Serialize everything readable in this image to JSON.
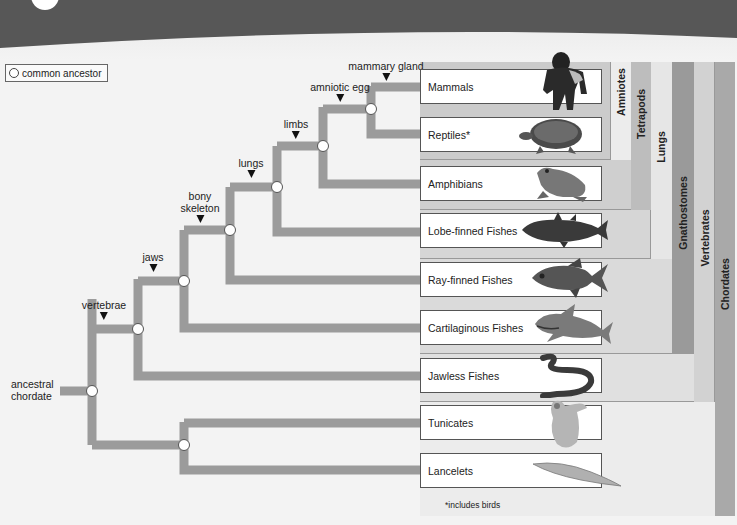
{
  "legend": {
    "label": "common ancestor"
  },
  "root": {
    "label_line1": "ancestral",
    "label_line2": "chordate"
  },
  "traits": [
    {
      "label": "mammary gland"
    },
    {
      "label": "amniotic egg"
    },
    {
      "label": "limbs"
    },
    {
      "label": "lungs"
    },
    {
      "label_line1": "bony",
      "label_line2": "skeleton"
    },
    {
      "label": "jaws"
    },
    {
      "label": "vertebrae"
    }
  ],
  "taxa": [
    {
      "label": "Mammals",
      "animal": "gorilla"
    },
    {
      "label": "Reptiles*",
      "animal": "turtle"
    },
    {
      "label": "Amphibians",
      "animal": "frog"
    },
    {
      "label": "Lobe-finned Fishes",
      "animal": "coelacanth"
    },
    {
      "label": "Ray-finned Fishes",
      "animal": "fish"
    },
    {
      "label": "Cartilaginous Fishes",
      "animal": "shark"
    },
    {
      "label": "Jawless Fishes",
      "animal": "lamprey"
    },
    {
      "label": "Tunicates",
      "animal": "tunicate"
    },
    {
      "label": "Lancelets",
      "animal": "lancelet"
    }
  ],
  "clades": [
    {
      "label": "Amniotes",
      "color": "#ececec"
    },
    {
      "label": "Tetrapods",
      "color": "#bdbdbd"
    },
    {
      "label": "Lungs",
      "color": "#e6e6e6"
    },
    {
      "label": "Gnathostomes",
      "color": "#9a9a9a"
    },
    {
      "label": "Vertebrates",
      "color": "#d2d2d2"
    },
    {
      "label": "Chordates",
      "color": "#a9a9a9"
    }
  ],
  "footnote": "*includes birds",
  "colors": {
    "branch": "#9b9b9b",
    "banner": "#555555"
  }
}
